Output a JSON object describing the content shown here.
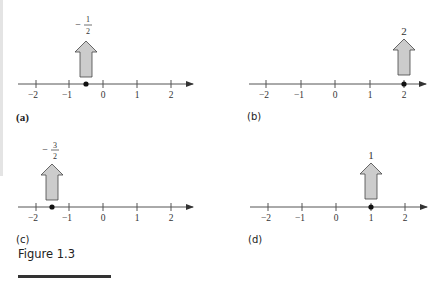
{
  "figure": {
    "title": "Figure 1.3",
    "panels": [
      {
        "id": "a",
        "caption": "(a)",
        "point": -0.5,
        "label_num": "1",
        "label_den": "2",
        "label_sign": "−",
        "label_type": "fraction",
        "ticks": [
          "−2",
          "−1",
          "0",
          "1",
          "2"
        ]
      },
      {
        "id": "b",
        "caption": "(b)",
        "point": 2,
        "label": "2",
        "label_type": "integer",
        "ticks": [
          "−2",
          "−1",
          "0",
          "1",
          "2"
        ]
      },
      {
        "id": "c",
        "caption": "(c)",
        "point": -1.5,
        "label_num": "3",
        "label_den": "2",
        "label_sign": "−",
        "label_type": "fraction",
        "ticks": [
          "−2",
          "−1",
          "0",
          "1",
          "2"
        ]
      },
      {
        "id": "d",
        "caption": "(d)",
        "point": 1,
        "label": "1",
        "label_type": "integer",
        "ticks": [
          "−2",
          "−1",
          "0",
          "1",
          "2"
        ]
      }
    ]
  },
  "colors": {
    "axis": "#555555",
    "arrow_fill": "#cccccc",
    "arrow_stroke": "#444444",
    "dot": "#111111",
    "text": "#222222",
    "left_strip": "#e4e4e4"
  }
}
